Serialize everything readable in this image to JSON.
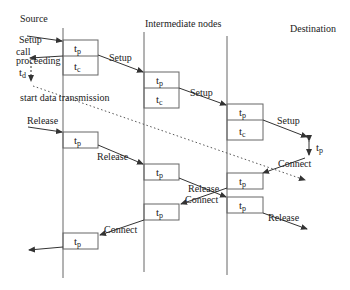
{
  "columns": {
    "source": "Source",
    "intermediate": "Intermediate nodes",
    "destination": "Destination"
  },
  "symbols": {
    "tp": "t",
    "tp_sub": "p",
    "tc": "t",
    "tc_sub": "c",
    "td": "t",
    "td_sub": "d"
  },
  "messages": {
    "setup": "Setup",
    "call_proceeding_1": "call",
    "call_proceeding_2": "proceeding",
    "start_data": "start data transmission",
    "release": "Release",
    "connect": "Connect"
  },
  "colors": {
    "line": "#555555",
    "text": "#222222"
  }
}
